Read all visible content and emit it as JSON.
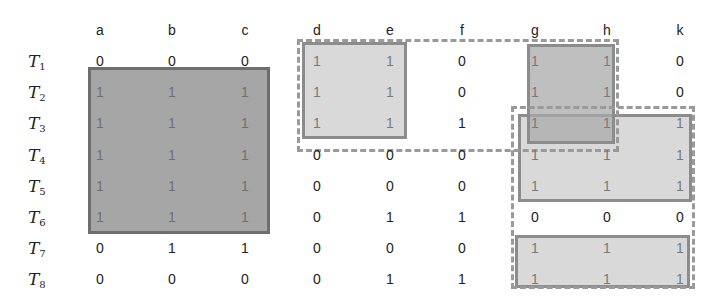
{
  "columns": [
    "a",
    "b",
    "c",
    "d",
    "e",
    "f",
    "g",
    "h",
    "k"
  ],
  "rows": [
    {
      "label": "T",
      "sub": "1",
      "values": [
        "0",
        "0",
        "0",
        "1",
        "1",
        "0",
        "1",
        "1",
        "0"
      ]
    },
    {
      "label": "T",
      "sub": "2",
      "values": [
        "1",
        "1",
        "1",
        "1",
        "1",
        "0",
        "1",
        "1",
        "0"
      ]
    },
    {
      "label": "T",
      "sub": "3",
      "values": [
        "1",
        "1",
        "1",
        "1",
        "1",
        "1",
        "1",
        "1",
        "1"
      ]
    },
    {
      "label": "T",
      "sub": "4",
      "values": [
        "1",
        "1",
        "1",
        "0",
        "0",
        "0",
        "1",
        "1",
        "1"
      ]
    },
    {
      "label": "T",
      "sub": "5",
      "values": [
        "1",
        "1",
        "1",
        "0",
        "0",
        "0",
        "1",
        "1",
        "1"
      ]
    },
    {
      "label": "T",
      "sub": "6",
      "values": [
        "1",
        "1",
        "1",
        "0",
        "1",
        "1",
        "0",
        "0",
        "0"
      ]
    },
    {
      "label": "T",
      "sub": "7",
      "values": [
        "0",
        "1",
        "1",
        "0",
        "0",
        "0",
        "1",
        "1",
        "1"
      ]
    },
    {
      "label": "T",
      "sub": "8",
      "values": [
        "0",
        "0",
        "0",
        "0",
        "1",
        "1",
        "1",
        "1",
        "1"
      ]
    }
  ],
  "highlights": [
    {
      "name": "block-abc-T2-T6",
      "style": "solid-dark",
      "columns": [
        "a",
        "b",
        "c"
      ],
      "rows": [
        "T2",
        "T6"
      ]
    },
    {
      "name": "block-de-T1-T3",
      "style": "solid-light",
      "columns": [
        "d",
        "e"
      ],
      "rows": [
        "T1",
        "T3"
      ]
    },
    {
      "name": "block-gh-T1-T3",
      "style": "solid-mid",
      "columns": [
        "g",
        "h"
      ],
      "rows": [
        "T1",
        "T3"
      ]
    },
    {
      "name": "block-ghk-T3-T5",
      "style": "solid-light",
      "columns": [
        "g",
        "h",
        "k"
      ],
      "rows": [
        "T3",
        "T5"
      ]
    },
    {
      "name": "block-ghk-T7-T8",
      "style": "solid-light",
      "columns": [
        "g",
        "h",
        "k"
      ],
      "rows": [
        "T7",
        "T8"
      ]
    },
    {
      "name": "dashed-deg-h-T1-T3",
      "style": "dashed",
      "columns": [
        "d",
        "h"
      ],
      "rows": [
        "T1",
        "T3"
      ]
    },
    {
      "name": "dashed-ghk-T3-T8",
      "style": "dashed",
      "columns": [
        "g",
        "k"
      ],
      "rows": [
        "T3",
        "T8"
      ]
    }
  ],
  "colors": {
    "dark_fill": "#a6a6a6",
    "light_fill": "#d9d9d9",
    "border": "#8c8c8c",
    "dashed": "#9a9a9a"
  }
}
